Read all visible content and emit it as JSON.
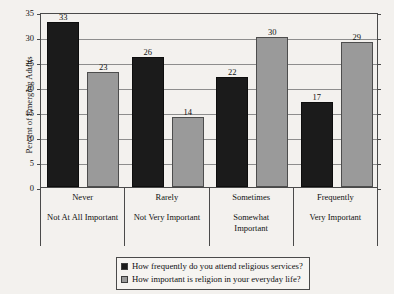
{
  "chart_data": {
    "type": "bar",
    "title": "",
    "xlabel": "",
    "ylabel": "Percent of Emerging Adults",
    "ylim": [
      0,
      35
    ],
    "ytick_labels": [
      "0",
      "5",
      "10",
      "15",
      "20",
      "25",
      "30",
      "35"
    ],
    "ytick_values": [
      0,
      5,
      10,
      15,
      20,
      25,
      30,
      35
    ],
    "grid": true,
    "legend_position": "bottom",
    "categories": [
      "Never",
      "Rarely",
      "Sometimes",
      "Frequently"
    ],
    "secondary_categories": [
      "Not At All Important",
      "Not Very Important",
      "Somewhat\nImportant",
      "Very Important"
    ],
    "series": [
      {
        "name": "How frequently do you attend religious services?",
        "color": "#1b1b1b",
        "values": [
          33,
          26,
          22,
          17
        ]
      },
      {
        "name": "How important is religion in your everyday life?",
        "color": "#9a9a9a",
        "values": [
          23,
          14,
          30,
          29
        ]
      }
    ]
  },
  "legend": {
    "items": [
      {
        "label": "How frequently do you attend religious services?",
        "swatch": "dark"
      },
      {
        "label": "How important is religion in your everyday life?",
        "swatch": "gray"
      }
    ]
  },
  "colors": {
    "background": "#f3f1ee",
    "series_dark": "#1b1b1b",
    "series_gray": "#9a9a9a",
    "axis": "#4a4a4a",
    "gridline": "#8d8d8d"
  }
}
